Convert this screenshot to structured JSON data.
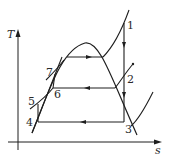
{
  "diagram": {
    "type": "T-s diagram",
    "axes": {
      "y_label": "T",
      "x_label": "s"
    },
    "states": [
      {
        "id": "1",
        "label": "1"
      },
      {
        "id": "2",
        "label": "2"
      },
      {
        "id": "3",
        "label": "3"
      },
      {
        "id": "4",
        "label": "4"
      },
      {
        "id": "5",
        "label": "5"
      },
      {
        "id": "6",
        "label": "6"
      },
      {
        "id": "7",
        "label": "7"
      }
    ],
    "colors": {
      "line": "#1e1e1e",
      "background": "#ffffff"
    }
  }
}
